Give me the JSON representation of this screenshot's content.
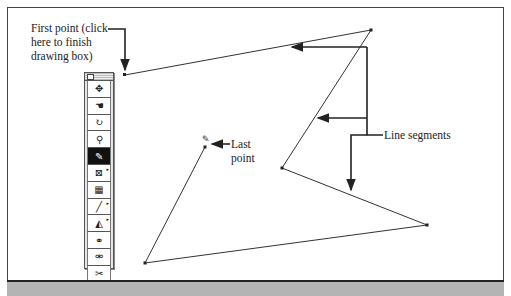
{
  "annotations": {
    "first_point": "First point (click\nhere to finish\ndrawing box)",
    "last_point": "Last\npoint",
    "line_segments": "Line segments"
  },
  "toolbox": {
    "tools": [
      {
        "name": "move-tool",
        "glyph": "✥",
        "selected": false
      },
      {
        "name": "grab-tool",
        "glyph": "☚",
        "selected": false
      },
      {
        "name": "rotate-tool",
        "glyph": "↻",
        "selected": false
      },
      {
        "name": "zoom-tool",
        "glyph": "🔍",
        "selected": false
      },
      {
        "name": "draw-box-tool",
        "glyph": "✎",
        "selected": true
      },
      {
        "name": "image-tool",
        "glyph": "⊠",
        "selected": false
      },
      {
        "name": "table-tool",
        "glyph": "▦",
        "selected": false
      },
      {
        "name": "line-tool",
        "glyph": "╱",
        "selected": false
      },
      {
        "name": "polygon-tool",
        "glyph": "◭",
        "selected": false
      },
      {
        "name": "link-tool",
        "glyph": "⚭",
        "selected": false
      },
      {
        "name": "unlink-tool",
        "glyph": "⚮",
        "selected": false
      },
      {
        "name": "cut-tool",
        "glyph": "✂",
        "selected": false
      }
    ]
  },
  "polygon": {
    "points": [
      [
        125,
        75
      ],
      [
        371,
        30
      ],
      [
        282,
        168
      ],
      [
        427,
        225
      ],
      [
        145,
        263
      ],
      [
        205,
        147
      ]
    ]
  },
  "colors": {
    "line": "#333333",
    "band": "#b4b4b4"
  }
}
